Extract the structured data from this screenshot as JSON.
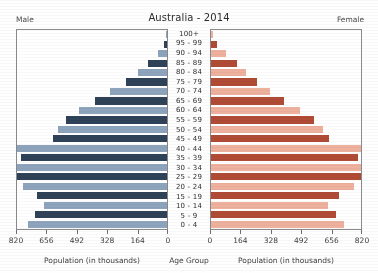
{
  "chart": {
    "title": "Australia - 2014",
    "left_corner_label": "Male",
    "right_corner_label": "Female",
    "left_caption": "Population (in thousands)",
    "center_caption": "Age Group",
    "right_caption": "Population (in thousands)"
  },
  "colors": {
    "male_dark": "#2f4257",
    "male_light": "#8ea4bd",
    "female_dark": "#b04b36",
    "female_light": "#edb19d",
    "frame": "#8a8a8a",
    "text": "#3a3a3a"
  },
  "chart_data": {
    "type": "bar",
    "subtype": "population-pyramid",
    "title": "Australia - 2014",
    "xlabel": "Population (in thousands)",
    "ylabel": "Age Group",
    "grid": false,
    "legend": [
      "Male",
      "Female"
    ],
    "legend_position": "top-corners",
    "xlim": [
      0,
      820
    ],
    "xticks_left": [
      820,
      656,
      492,
      328,
      164,
      0
    ],
    "xticks_right": [
      0,
      164,
      328,
      492,
      656,
      820
    ],
    "units": "thousands",
    "categories": [
      "100+",
      "95 - 99",
      "90 - 94",
      "85 - 89",
      "80 - 84",
      "75 - 79",
      "70 - 74",
      "65 - 69",
      "60 - 64",
      "55 - 59",
      "50 - 54",
      "45 - 49",
      "40 - 44",
      "35 - 39",
      "30 - 34",
      "25 - 29",
      "20 - 24",
      "15 - 19",
      "10 - 14",
      "5 - 9",
      "0 - 4"
    ],
    "series": [
      {
        "name": "Male",
        "side": "left",
        "values": [
          3,
          17,
          50,
          106,
          158,
          225,
          311,
          394,
          479,
          551,
          594,
          622,
          820,
          796,
          820,
          820,
          786,
          710,
          670,
          720,
          760
        ]
      },
      {
        "name": "Female",
        "side": "right",
        "values": [
          9,
          34,
          80,
          141,
          192,
          249,
          325,
          401,
          486,
          561,
          614,
          646,
          820,
          805,
          820,
          820,
          782,
          700,
          640,
          686,
          726
        ]
      }
    ]
  }
}
